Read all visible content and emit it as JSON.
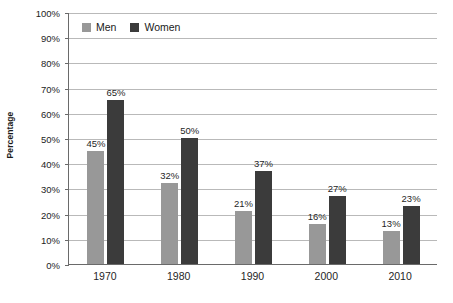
{
  "chart_data": {
    "type": "bar",
    "title": "",
    "subtitle": "",
    "xlabel": "",
    "ylabel": "Percentage",
    "categories": [
      "1970",
      "1980",
      "1990",
      "2000",
      "2010"
    ],
    "series": [
      {
        "name": "Men",
        "color": "#989898",
        "values": [
          45,
          32,
          21,
          16,
          13
        ],
        "labels": [
          "45%",
          "32%",
          "21%",
          "16%",
          "13%"
        ]
      },
      {
        "name": "Women",
        "color": "#3b3b3b",
        "values": [
          65,
          50,
          37,
          27,
          23
        ],
        "labels": [
          "65%",
          "50%",
          "37%",
          "27%",
          "23%"
        ]
      }
    ],
    "ylim": [
      0,
      100
    ],
    "ytick_step": 10,
    "ytick_labels": [
      "100%",
      "90%",
      "80%",
      "70%",
      "60%",
      "50%",
      "40%",
      "30%",
      "20%",
      "10%",
      "0%"
    ],
    "ytick_values": [
      100,
      90,
      80,
      70,
      60,
      50,
      40,
      30,
      20,
      10,
      0
    ],
    "grid": true,
    "grid_axis": "y",
    "legend_position": "top-left",
    "value_labels": true
  },
  "axis": {
    "y_title": "Percentage"
  },
  "legend": {
    "items": [
      {
        "label": "Men"
      },
      {
        "label": "Women"
      }
    ]
  },
  "colors": {
    "men": "#989898",
    "women": "#3b3b3b",
    "gridline": "#b9b9b9",
    "axis": "#6a6a6a",
    "background": "#ffffff",
    "text": "#1f1f1f"
  }
}
